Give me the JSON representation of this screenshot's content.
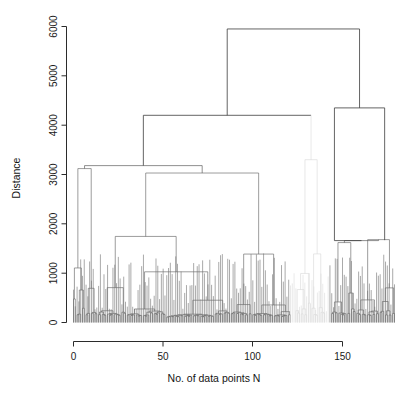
{
  "figure": {
    "type": "dendrogram",
    "background": "#ffffff",
    "line_color": "#606060",
    "axis_color": "#2b2b2b"
  },
  "chart_data": {
    "type": "line",
    "plot_kind": "dendrogram",
    "title": "",
    "xlabel": "No. of data points N",
    "ylabel": "Distance",
    "xlim": [
      0,
      180
    ],
    "ylim": [
      0,
      6200
    ],
    "xticks": [
      0,
      50,
      100,
      150
    ],
    "xticklabels": [
      "0",
      "50",
      "100",
      "150"
    ],
    "yticks": [
      0,
      1000,
      2000,
      3000,
      4000,
      5000,
      6000
    ],
    "yticklabels": [
      "0",
      "1000",
      "2000",
      "3000",
      "4000",
      "5000",
      "6000"
    ],
    "grid": false,
    "legend": null,
    "n_leaves": 180,
    "key_merges": [
      {
        "label": "root",
        "height": 5950,
        "x_left": 73,
        "x_right": 152
      },
      {
        "label": "left-super",
        "height": 4200,
        "x_left": 12,
        "x_right": 132
      },
      {
        "label": "left-A",
        "height": 3120,
        "x_left": 3,
        "x_right": 22
      },
      {
        "label": "left-B",
        "height": 3030,
        "x_left": 5,
        "x_right": 108
      },
      {
        "label": "right-top",
        "height": 4350,
        "x_left": 145,
        "x_right": 168
      },
      {
        "label": "right-split",
        "height": 1650,
        "x_left": 148,
        "x_right": 173
      }
    ],
    "cluster_spans": [
      {
        "name": "left-cluster",
        "x_from": 0,
        "x_to": 122
      },
      {
        "name": "faint-middle",
        "x_from": 122,
        "x_to": 140
      },
      {
        "name": "right-cluster",
        "x_from": 143,
        "x_to": 180
      }
    ],
    "leaf_height_range": [
      150,
      1450
    ]
  },
  "axes": {
    "y_title": "Distance",
    "x_title": "No. of data points N"
  }
}
